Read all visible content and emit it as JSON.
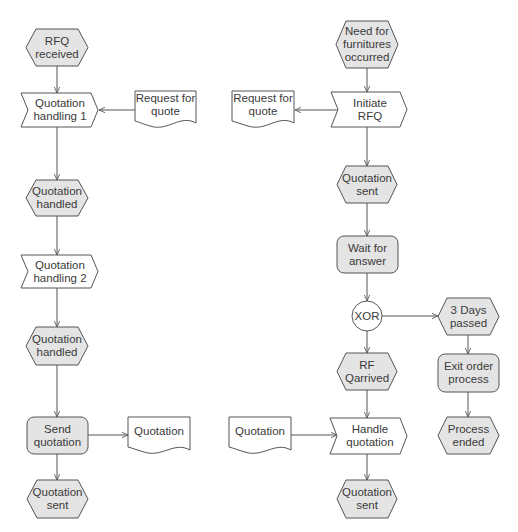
{
  "colors": {
    "stroke": "#555555",
    "event_fill": "#e4e4e4",
    "function_fill": "#e4e4e4",
    "white": "#ffffff",
    "text": "#3a3a3a"
  },
  "left_process": {
    "start_event": "RFQ\nreceived",
    "function_1": "Quotation\nhandling 1",
    "input_doc": "Request for\nquote",
    "event_2": "Quotation\nhandled",
    "function_2": "Quotation\nhandling 2",
    "event_3": "Quotation\nhandled",
    "send_function": "Send\nquotation",
    "output_doc": "Quotation",
    "end_event": "Quotation\nsent"
  },
  "right_process": {
    "start_event": "Need for\nfurnitures\noccurred",
    "initiate_function": "Initiate\nRFQ",
    "output_doc": "Request for\nquote",
    "event_sent": "Quotation\nsent",
    "wait_function": "Wait for\nanswer",
    "xor_gateway": "XOR",
    "timeout_event": "3 Days\npassed",
    "exit_function": "Exit order\nprocess",
    "process_ended_event": "Process\nended",
    "arrived_event": "RF\nQarrived",
    "input_doc": "Quotation",
    "handle_function": "Handle\nquotation",
    "end_event": "Quotation\nsent"
  }
}
